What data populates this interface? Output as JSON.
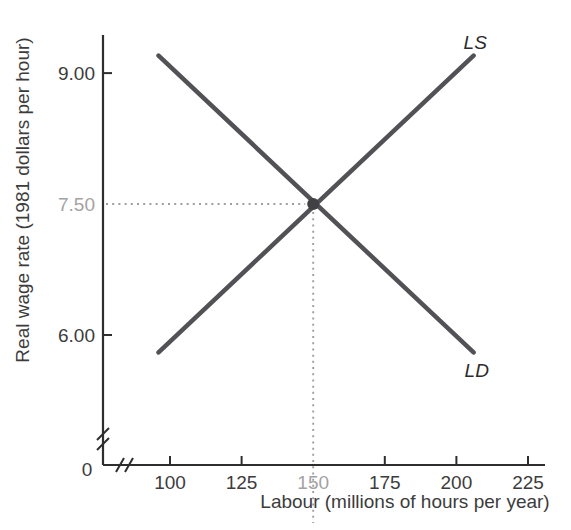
{
  "page": {
    "background": "#ffffff"
  },
  "chart_data": {
    "type": "line",
    "title": "",
    "xlabel": "Labour (millions of hours per year)",
    "ylabel": "Real wage rate (1981 dollars per hour)",
    "origin_label": "0",
    "axis_break": {
      "x": true,
      "y": true
    },
    "axis_color": "#2e2e2e",
    "label_color": "#3c3c3c",
    "muted_label_color": "#a3a3a3",
    "grid": false,
    "legend": "inline curve labels",
    "x_ticks": [
      {
        "value": 100,
        "label": "100",
        "muted": false,
        "tick": true
      },
      {
        "value": 125,
        "label": "125",
        "muted": false,
        "tick": true
      },
      {
        "value": 150,
        "label": "150",
        "muted": true,
        "tick": false
      },
      {
        "value": 175,
        "label": "175",
        "muted": false,
        "tick": true
      },
      {
        "value": 200,
        "label": "200",
        "muted": false,
        "tick": true
      },
      {
        "value": 225,
        "label": "225",
        "muted": false,
        "tick": true
      }
    ],
    "y_ticks": [
      {
        "value": 6.0,
        "label": "6.00",
        "muted": false,
        "tick": true
      },
      {
        "value": 7.5,
        "label": "7.50",
        "muted": true,
        "tick": false
      },
      {
        "value": 9.0,
        "label": "9.00",
        "muted": false,
        "tick": true
      }
    ],
    "series": [
      {
        "name": "LD",
        "label": "LD",
        "points": [
          [
            96,
            9.2
          ],
          [
            206,
            5.8
          ]
        ],
        "color": "#515156",
        "label_anchor": "end_of_line",
        "label_offset": [
          -9,
          25
        ]
      },
      {
        "name": "LS",
        "label": "LS",
        "points": [
          [
            96,
            5.8
          ],
          [
            206,
            9.2
          ]
        ],
        "color": "#515156",
        "label_anchor": "end_of_line",
        "label_offset": [
          -10,
          -7
        ]
      }
    ],
    "equilibrium": {
      "x": 150,
      "y": 7.5,
      "x_label": "150",
      "y_label": "7.50",
      "marker_color": "#404045",
      "guide_color": "#9e9e9e"
    }
  }
}
